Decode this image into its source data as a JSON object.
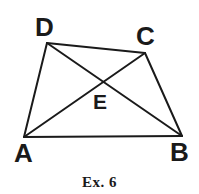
{
  "figure": {
    "caption": "Ex. 6",
    "background_color": "#ffffff",
    "stroke_color": "#1a1a1a",
    "label_color": "#1a1a1a",
    "stroke_width": 2,
    "shape": "quadrilateral-with-diagonals",
    "vertices": [
      {
        "id": "D",
        "label": "D",
        "x": 47,
        "y": 43
      },
      {
        "id": "C",
        "label": "C",
        "x": 145,
        "y": 53
      },
      {
        "id": "A",
        "label": "A",
        "x": 24,
        "y": 137
      },
      {
        "id": "B",
        "label": "B",
        "x": 182,
        "y": 136
      },
      {
        "id": "E",
        "label": "E",
        "x": 103,
        "y": 83
      }
    ],
    "edges": [
      {
        "id": "DC",
        "from": "D",
        "to": "C"
      },
      {
        "id": "CB",
        "from": "C",
        "to": "B"
      },
      {
        "id": "BA",
        "from": "B",
        "to": "A"
      },
      {
        "id": "AD",
        "from": "A",
        "to": "D"
      }
    ],
    "diagonals": [
      {
        "id": "AC",
        "from": "A",
        "to": "C"
      },
      {
        "id": "DB",
        "from": "D",
        "to": "B"
      }
    ],
    "intersection_label": "E"
  }
}
